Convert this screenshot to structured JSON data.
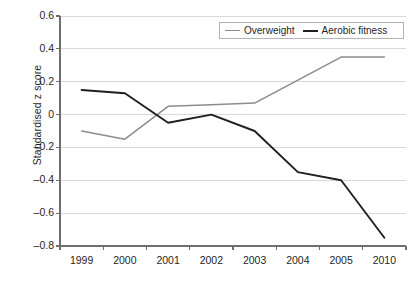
{
  "chart_data": {
    "type": "line",
    "title": "",
    "xlabel": "",
    "ylabel": "Standardised z score",
    "categories": [
      "1999",
      "2000",
      "2001",
      "2002",
      "2003",
      "2004",
      "2005",
      "2010"
    ],
    "ylim": [
      -0.8,
      0.6
    ],
    "ytick_labels": [
      "0.6",
      "0.4",
      "0.2",
      "0",
      "–0.2",
      "–0.4",
      "–0.6",
      "–0.8"
    ],
    "ytick_values": [
      0.6,
      0.4,
      0.2,
      0,
      -0.2,
      -0.4,
      -0.6,
      -0.8
    ],
    "grid": true,
    "grid_axis": "y",
    "legend_position": "top-right",
    "series": [
      {
        "name": "Overweight",
        "color": "#8c8c8c",
        "values": [
          -0.1,
          -0.15,
          0.05,
          0.06,
          0.07,
          0.21,
          0.35,
          0.35
        ]
      },
      {
        "name": "Aerobic fitness",
        "color": "#1f1f1f",
        "values": [
          0.15,
          0.13,
          -0.05,
          0.0,
          -0.1,
          -0.35,
          -0.4,
          -0.75
        ]
      }
    ]
  },
  "legend": {
    "items": [
      {
        "label": "Overweight"
      },
      {
        "label": "Aerobic fitness"
      }
    ]
  },
  "caption": {
    "text": ""
  },
  "colors": {
    "overweight": "#8c8c8c",
    "aerobic_fitness": "#1f1f1f",
    "grid": "#d9d9d9",
    "axis": "#6e6e6e"
  }
}
